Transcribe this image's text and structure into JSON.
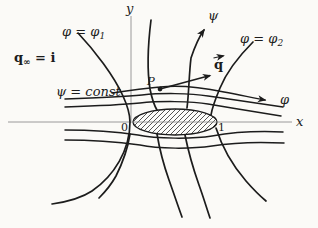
{
  "figure_title": "Potential flow past an ellipse: streamlines and equipotential lines",
  "colors": {
    "ink": "#1c1c1c",
    "axis": "#8f8f8f",
    "background": "#fbfaf7"
  },
  "labels": {
    "free_stream_q": "q",
    "free_stream_sub": "∞",
    "free_stream_rhs": " = i",
    "phi1_main": "φ = φ",
    "phi1_sub": "1",
    "phi2_main": "φ = φ",
    "phi2_sub": "2",
    "psi_const": "ψ = const",
    "psi_arrow": "ψ",
    "phi_arrow": "φ",
    "q_vector": "q",
    "point_p": "P",
    "origin": "0",
    "unit_point": "1",
    "x_axis": "x",
    "y_axis": "y"
  }
}
